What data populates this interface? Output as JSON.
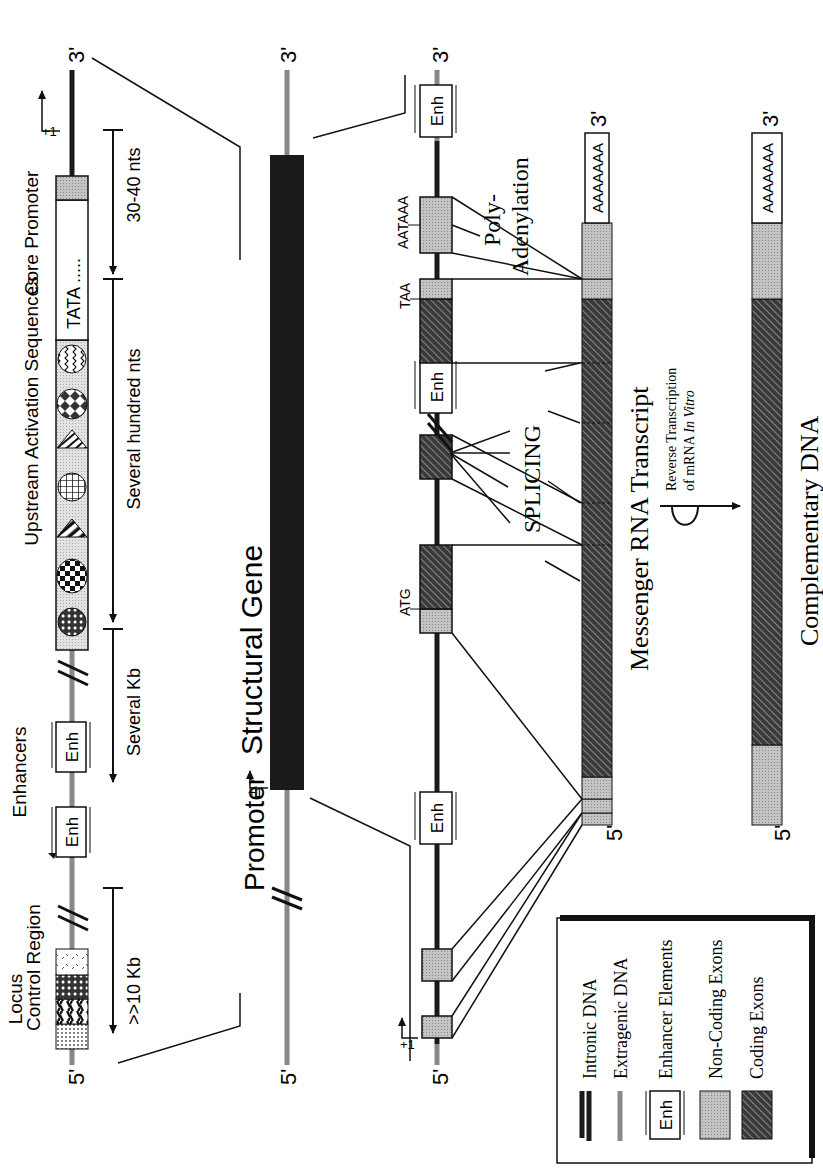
{
  "orientation": "rotated-90-ccw",
  "colors": {
    "ink": "#1a1a1a",
    "extragenic_dna": "#8a8a8a",
    "non_coding_exon": "#b8b8b8",
    "coding_exon": "#2a2a2a",
    "uas_fill": "#d8d8d8",
    "background": "#ffffff"
  },
  "row_promoter_detail": {
    "five_prime": "5'",
    "three_prime": "3'",
    "locus_control_region": {
      "line1": "Locus",
      "line2": "Control Region"
    },
    "enhancers_label": "Enhancers",
    "uas_label": "Upstream Activation Sequences",
    "core_promoter_label": "Core Promoter",
    "tata_label": "TATA .....",
    "plus_one": "+1",
    "enh_label": "Enh",
    "distances": {
      "lcr": ">>10 Kb",
      "enhancers": "Several Kb",
      "uas": "Several hundred nts",
      "core": "30-40 nts"
    }
  },
  "row_overview": {
    "five_prime": "5'",
    "three_prime": "3'",
    "promoter_label": "Promoter",
    "gene_label": "Structural Gene",
    "plus_one": "+1"
  },
  "row_gene_detail": {
    "five_prime": "5'",
    "three_prime": "3'",
    "plus_one": "+1",
    "enh_label": "Enh",
    "atg_label": "ATG",
    "taa_label": "TAA",
    "aataaa_label": "AATAAA",
    "splicing_label": "SPLICING",
    "polyadenylation": {
      "line1": "Poly-",
      "line2": "Adenylation"
    }
  },
  "mrna": {
    "five_prime": "5'",
    "three_prime": "3'",
    "poly_a": "AAAAAAA",
    "label": "Messenger RNA Transcript"
  },
  "reverse_transcription": {
    "line1": "Reverse Transcription",
    "line2_prefix": "of mRNA ",
    "line2_italic": "In Vitro"
  },
  "cdna": {
    "five_prime": "5'",
    "three_prime": "3'",
    "poly_a": "AAAAAAA",
    "label": "Complementary DNA"
  },
  "legend": {
    "items": [
      {
        "icon": "intronic-dna-line",
        "label": "Intronic DNA"
      },
      {
        "icon": "extragenic-dna-line",
        "label": "Extragenic DNA"
      },
      {
        "icon": "enhancer-box",
        "icon_text": "Enh",
        "label": "Enhancer Elements"
      },
      {
        "icon": "non-coding-exon-swatch",
        "label": "Non-Coding Exons"
      },
      {
        "icon": "coding-exon-swatch",
        "label": "Coding Exons"
      }
    ]
  }
}
